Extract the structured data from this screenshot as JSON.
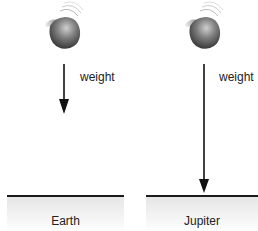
{
  "panels": [
    {
      "planet": "Earth",
      "force_label": "weight",
      "ball_center": [
        66,
        30
      ],
      "arrow": {
        "x": 64,
        "y_start": 64,
        "y_end": 113
      },
      "ground": {
        "x_start": 7,
        "x_end": 124,
        "y": 195
      }
    },
    {
      "planet": "Jupiter",
      "force_label": "weight",
      "ball_center": [
        206,
        30
      ],
      "arrow": {
        "x": 204,
        "y_start": 64,
        "y_end": 193
      },
      "ground": {
        "x_start": 146,
        "x_end": 258,
        "y": 195
      }
    }
  ],
  "colors": {
    "ball_light": "#bdbdbd",
    "ball_dark": "#3a3a3a",
    "arrow": "#111111",
    "ground_line": "#1a1a1a",
    "ground_fill": "#e6e6e6"
  }
}
